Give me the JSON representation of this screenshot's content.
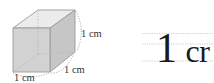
{
  "diagram": {
    "cube": {
      "face_color": "#d4d4d4",
      "top_color": "#ebebeb",
      "side_color": "#c4c4c4",
      "edge_color": "#9a9a9a",
      "hidden_edge_color": "#b0b0b0",
      "dim_arc_color": "#888888"
    },
    "labels": {
      "height": "1 cm",
      "depth": "1 cm",
      "width": "1 cm"
    },
    "guide_text": {
      "number": "1",
      "unit": "cr",
      "guide_line_color": "#bdbdbd"
    }
  }
}
